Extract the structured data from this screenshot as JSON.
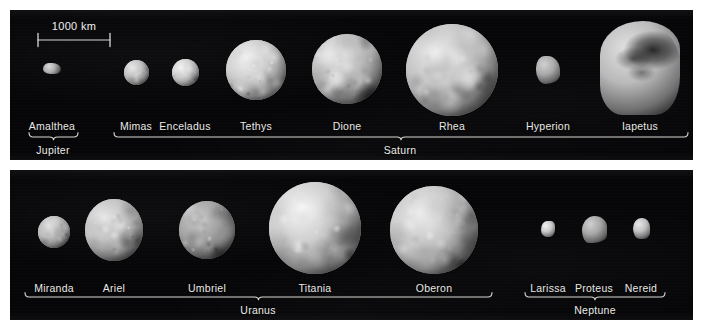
{
  "figure": {
    "background_color": "#ffffff",
    "plate_color": "#060608",
    "label_color": "#e9e9e6",
    "rule_color": "#d8d8d4"
  },
  "scale_bar": {
    "label": "1000 km",
    "x_start": 38,
    "x_end": 110,
    "y": 40,
    "text_x": 74,
    "text_y": 20
  },
  "rows": [
    {
      "row": "top",
      "groups": [
        {
          "planet": "Jupiter",
          "bracket": {
            "x_start": 29,
            "x_end": 78,
            "y": 137,
            "label_x": 53,
            "label_y": 144
          },
          "moons": [
            {
              "name": "Amalthea",
              "shape": "irregular",
              "cx": 52,
              "cy": 68,
              "w": 18,
              "h": 11,
              "label_x": 52,
              "label_y": 120,
              "albedo": 0.52
            }
          ]
        },
        {
          "planet": "Saturn",
          "bracket": {
            "x_start": 114,
            "x_end": 688,
            "y": 137,
            "label_x": 400,
            "label_y": 144
          },
          "moons": [
            {
              "name": "Mimas",
              "shape": "sphere",
              "cx": 136,
              "cy": 72,
              "w": 25,
              "h": 25,
              "label_x": 136,
              "label_y": 120,
              "albedo": 0.62
            },
            {
              "name": "Enceladus",
              "shape": "sphere",
              "cx": 185,
              "cy": 72,
              "w": 27,
              "h": 27,
              "label_x": 185,
              "label_y": 120,
              "albedo": 0.72
            },
            {
              "name": "Tethys",
              "shape": "sphere",
              "cx": 256,
              "cy": 70,
              "w": 60,
              "h": 60,
              "label_x": 256,
              "label_y": 120,
              "albedo": 0.7
            },
            {
              "name": "Dione",
              "shape": "sphere",
              "cx": 347,
              "cy": 69,
              "w": 70,
              "h": 70,
              "label_x": 347,
              "label_y": 120,
              "albedo": 0.6
            },
            {
              "name": "Rhea",
              "shape": "sphere",
              "cx": 452,
              "cy": 70,
              "w": 92,
              "h": 92,
              "label_x": 452,
              "label_y": 120,
              "albedo": 0.64
            },
            {
              "name": "Hyperion",
              "shape": "irregular",
              "cx": 548,
              "cy": 70,
              "w": 24,
              "h": 28,
              "label_x": 548,
              "label_y": 120,
              "albedo": 0.46
            },
            {
              "name": "Iapetus",
              "shape": "irregular",
              "cx": 640,
              "cy": 68,
              "w": 80,
              "h": 94,
              "label_x": 640,
              "label_y": 120,
              "albedo": 0.58
            }
          ]
        }
      ]
    },
    {
      "row": "bottom",
      "groups": [
        {
          "planet": "Uranus",
          "bracket": {
            "x_start": 25,
            "x_end": 492,
            "y": 297,
            "label_x": 258,
            "label_y": 304
          },
          "moons": [
            {
              "name": "Miranda",
              "shape": "sphere",
              "cx": 54,
              "cy": 232,
              "w": 32,
              "h": 32,
              "label_x": 54,
              "label_y": 282,
              "albedo": 0.58
            },
            {
              "name": "Ariel",
              "shape": "sphere",
              "cx": 114,
              "cy": 230,
              "w": 58,
              "h": 62,
              "label_x": 114,
              "label_y": 282,
              "albedo": 0.62
            },
            {
              "name": "Umbriel",
              "shape": "sphere",
              "cx": 207,
              "cy": 230,
              "w": 56,
              "h": 58,
              "label_x": 207,
              "label_y": 282,
              "albedo": 0.4
            },
            {
              "name": "Titania",
              "shape": "sphere",
              "cx": 315,
              "cy": 228,
              "w": 92,
              "h": 92,
              "label_x": 315,
              "label_y": 282,
              "albedo": 0.7
            },
            {
              "name": "Oberon",
              "shape": "sphere",
              "cx": 434,
              "cy": 230,
              "w": 88,
              "h": 88,
              "label_x": 434,
              "label_y": 282,
              "albedo": 0.66
            }
          ]
        },
        {
          "planet": "Neptune",
          "bracket": {
            "x_start": 525,
            "x_end": 665,
            "y": 297,
            "label_x": 595,
            "label_y": 304
          },
          "moons": [
            {
              "name": "Larissa",
              "shape": "irregular",
              "cx": 548,
              "cy": 229,
              "w": 14,
              "h": 16,
              "label_x": 548,
              "label_y": 282,
              "albedo": 0.7
            },
            {
              "name": "Proteus",
              "shape": "irregular",
              "cx": 594,
              "cy": 229,
              "w": 25,
              "h": 27,
              "label_x": 594,
              "label_y": 282,
              "albedo": 0.44
            },
            {
              "name": "Nereid",
              "shape": "irregular",
              "cx": 641,
              "cy": 228,
              "w": 17,
              "h": 21,
              "label_x": 641,
              "label_y": 282,
              "albedo": 0.62
            }
          ]
        }
      ]
    }
  ]
}
